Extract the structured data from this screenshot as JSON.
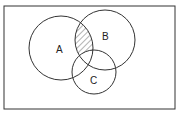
{
  "diagram": {
    "type": "venn",
    "universe": {
      "x": 4,
      "y": 6,
      "w": 171,
      "h": 103
    },
    "sets": [
      {
        "id": "A",
        "label": "A",
        "cx": 61,
        "cy": 48,
        "r": 32,
        "label_x": 58,
        "label_y": 52
      },
      {
        "id": "B",
        "label": "B",
        "cx": 105,
        "cy": 40,
        "r": 30,
        "label_x": 105,
        "label_y": 40
      },
      {
        "id": "C",
        "label": "C",
        "cx": 94,
        "cy": 72,
        "r": 22,
        "label_x": 93,
        "label_y": 84
      }
    ],
    "shaded_region": "A ∩ B − C",
    "colors": {
      "stroke": "#333333",
      "hatch": "#444444",
      "background": "#ffffff"
    }
  }
}
